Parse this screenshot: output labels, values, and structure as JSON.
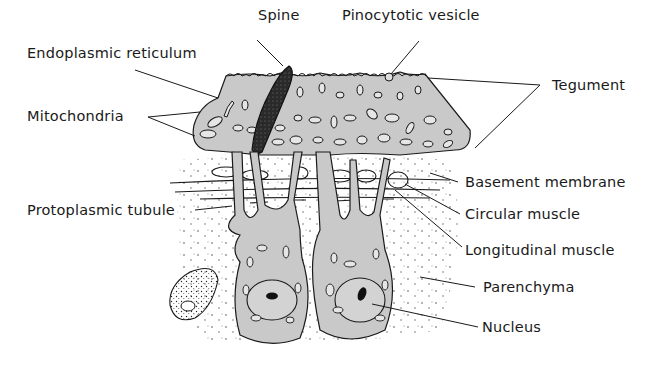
{
  "figure": {
    "type": "anatomical-diagram",
    "colors": {
      "background": "#ffffff",
      "cytoplasm": "#c9c9c9",
      "outline": "#1a1a1a",
      "spine": "#1e1e1e"
    }
  },
  "labels": {
    "spine": "Spine",
    "pinocytotic_vesicle": "Pinocytotic vesicle",
    "endoplasmic_reticulum": "Endoplasmic reticulum",
    "tegument": "Tegument",
    "mitochondria": "Mitochondria",
    "basement_membrane": "Basement membrane",
    "protoplasmic_tubule": "Protoplasmic tubule",
    "circular_muscle": "Circular muscle",
    "longitudinal_muscle": "Longitudinal muscle",
    "parenchyma": "Parenchyma",
    "nucleus": "Nucleus"
  }
}
